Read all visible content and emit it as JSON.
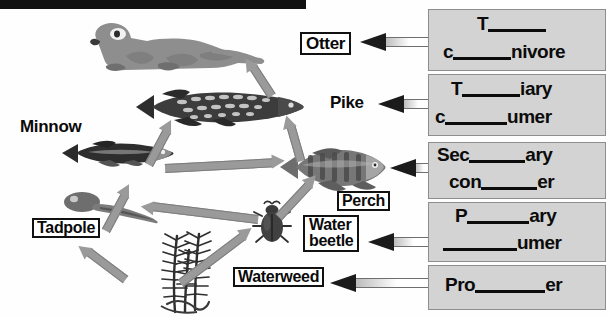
{
  "page": {
    "background": "#ffffff",
    "topbar_color": "#111111"
  },
  "diagram": {
    "organism_labels": [
      {
        "id": "otter",
        "text": "Otter",
        "boxed": true,
        "x": 300,
        "y": 32,
        "font_size": 17
      },
      {
        "id": "pike",
        "text": "Pike",
        "boxed": false,
        "x": 330,
        "y": 93,
        "font_size": 17
      },
      {
        "id": "minnow",
        "text": "Minnow",
        "boxed": false,
        "x": 20,
        "y": 117,
        "font_size": 17
      },
      {
        "id": "perch",
        "text": "Perch",
        "boxed": true,
        "x": 337,
        "y": 191,
        "font_size": 16
      },
      {
        "id": "tadpole",
        "text": "Tadpole",
        "boxed": true,
        "x": 32,
        "y": 218,
        "font_size": 16
      },
      {
        "id": "waterbeetle",
        "text": "Water\nbeetle",
        "boxed": true,
        "x": 303,
        "y": 218,
        "font_size": 16
      },
      {
        "id": "waterweed",
        "text": "Waterweed",
        "boxed": true,
        "x": 233,
        "y": 267,
        "font_size": 16
      }
    ],
    "organisms": [
      {
        "id": "otter",
        "name": "otter-illustration"
      },
      {
        "id": "pike",
        "name": "pike-illustration"
      },
      {
        "id": "minnow",
        "name": "minnow-illustration"
      },
      {
        "id": "perch",
        "name": "perch-illustration"
      },
      {
        "id": "tadpole",
        "name": "tadpole-illustration"
      },
      {
        "id": "waterbeetle",
        "name": "water-beetle-illustration"
      },
      {
        "id": "waterweed",
        "name": "waterweed-illustration"
      }
    ],
    "food_chain_arrows": [
      {
        "from": "waterweed",
        "to": "tadpole"
      },
      {
        "from": "waterweed",
        "to": "waterbeetle"
      },
      {
        "from": "tadpole",
        "to": "minnow"
      },
      {
        "from": "waterbeetle",
        "to": "minnow"
      },
      {
        "from": "waterbeetle",
        "to": "perch"
      },
      {
        "from": "minnow",
        "to": "perch"
      },
      {
        "from": "minnow",
        "to": "pike"
      },
      {
        "from": "perch",
        "to": "pike"
      },
      {
        "from": "pike",
        "to": "otter"
      }
    ],
    "arrow_color": "#9a9a9a"
  },
  "answer_boxes": [
    {
      "id": "box-top-carnivore",
      "points_to": "otter",
      "line1": {
        "prefix": "T",
        "blank": true,
        "suffix": ""
      },
      "line2": {
        "prefix": "c",
        "blank": true,
        "suffix": "nivore"
      }
    },
    {
      "id": "box-tertiary-consumer",
      "points_to": "pike",
      "line1": {
        "prefix": "T",
        "blank": true,
        "suffix": "iary"
      },
      "line2": {
        "prefix": "c",
        "blank": true,
        "suffix": "umer"
      }
    },
    {
      "id": "box-secondary-consumer",
      "points_to": "perch",
      "line1": {
        "prefix": "Sec",
        "blank": true,
        "suffix": "ary"
      },
      "line2": {
        "prefix": "con",
        "blank": true,
        "suffix": "er"
      }
    },
    {
      "id": "box-primary-consumer",
      "points_to": "waterbeetle",
      "line1": {
        "prefix": "P",
        "blank": true,
        "suffix": "ary"
      },
      "line2": {
        "prefix": "",
        "blank": true,
        "suffix": "umer"
      }
    },
    {
      "id": "box-producer",
      "points_to": "waterweed",
      "line1": {
        "prefix": "Pro",
        "blank": true,
        "suffix": "er"
      },
      "line2": null
    }
  ],
  "colors": {
    "answer_box_fill": "#d3d3d3",
    "answer_box_border": "#8d8d8d",
    "ink": "#0b0b0b",
    "arrow_grey": "#9a9a9a",
    "arrow_head_dark": "#1b1b1b"
  }
}
